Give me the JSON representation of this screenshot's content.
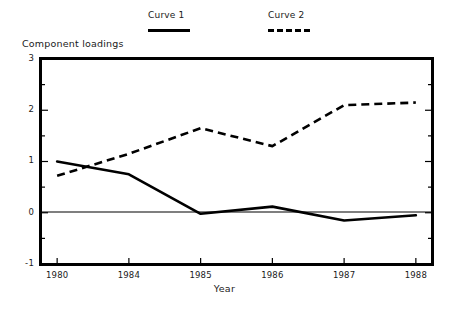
{
  "legend": {
    "position": "top-center",
    "entries": [
      {
        "label": "Curve 1",
        "style": "solid",
        "color": "#000000"
      },
      {
        "label": "Curve 2",
        "style": "dashed",
        "color": "#000000"
      }
    ]
  },
  "axes": {
    "title": "Component loadings",
    "xlabel": "Year",
    "ylabel": "",
    "yticks": [
      "3",
      "2",
      "1",
      "0",
      "-1"
    ],
    "xticks": [
      "1980",
      "1984",
      "1985",
      "1986",
      "1987",
      "1988"
    ],
    "zero_line": true,
    "grid": false
  },
  "chart_data": {
    "type": "line",
    "title": "Component loadings",
    "xlabel": "Year",
    "ylabel": "Component loadings",
    "categories": [
      "1980",
      "1984",
      "1985",
      "1986",
      "1987",
      "1988"
    ],
    "series": [
      {
        "name": "Curve 1",
        "style": "solid",
        "color": "#000000",
        "values": [
          1.0,
          0.75,
          -0.02,
          0.12,
          -0.15,
          -0.05
        ]
      },
      {
        "name": "Curve 2",
        "style": "dashed",
        "color": "#000000",
        "values": [
          0.72,
          1.15,
          1.65,
          1.3,
          2.1,
          2.15
        ]
      }
    ],
    "ylim": [
      -1,
      3
    ],
    "ytick_values": [
      3,
      2,
      1,
      0,
      -1
    ],
    "yminor_step": 0.5,
    "grid": false,
    "legend_position": "top-center"
  }
}
